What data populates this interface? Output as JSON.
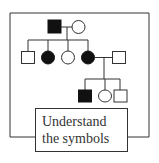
{
  "diagram": {
    "type": "pedigree-chart",
    "colors": {
      "line": "#333333",
      "affected": "#111111",
      "unaffected": "#ffffff"
    },
    "generations": [
      {
        "id": "I",
        "individuals": [
          {
            "sex": "male",
            "affected": true
          },
          {
            "sex": "female",
            "affected": false
          }
        ]
      },
      {
        "id": "II",
        "individuals": [
          {
            "sex": "male",
            "affected": false
          },
          {
            "sex": "female",
            "affected": true
          },
          {
            "sex": "female",
            "affected": false
          },
          {
            "sex": "female",
            "affected": true
          },
          {
            "sex": "male",
            "affected": false,
            "note": "spouse"
          }
        ]
      },
      {
        "id": "III",
        "individuals": [
          {
            "sex": "male",
            "affected": true
          },
          {
            "sex": "female",
            "affected": false
          },
          {
            "sex": "male",
            "affected": false
          }
        ]
      }
    ]
  },
  "label": {
    "line1": "Understand",
    "line2": "the symbols"
  }
}
